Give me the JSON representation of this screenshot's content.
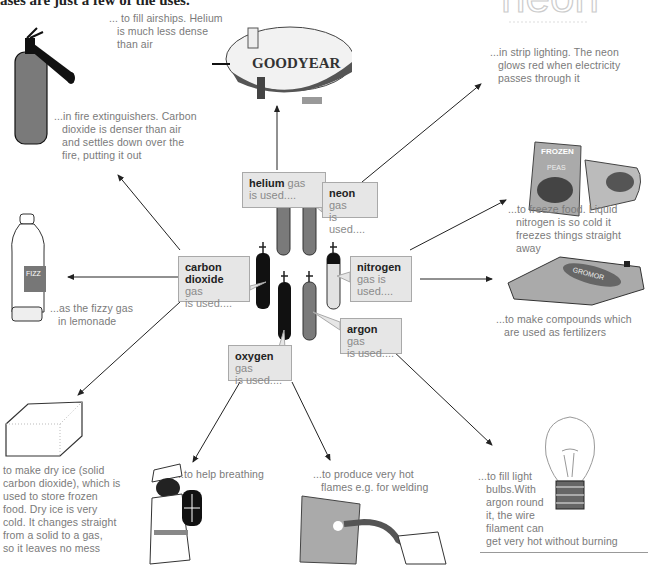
{
  "header_fragment": "ases are just a few of the uses.",
  "neon_sign_text": "neon",
  "gases": [
    {
      "id": "helium",
      "name": "helium",
      "suffix": " gas",
      "line2": "is used....",
      "cylinder_color": "#7a7a7a",
      "cap_color": "#7a7a7a"
    },
    {
      "id": "neon",
      "name": "neon",
      "suffix": " gas",
      "line2": "is used....",
      "cylinder_color": "#7a7a7a",
      "cap_color": "#111111"
    },
    {
      "id": "carbon-dioxide",
      "name": "carbon",
      "name2": "dioxide",
      "suffix": " gas",
      "line2": "is used....",
      "cylinder_color": "#111111",
      "cap_color": "#111111"
    },
    {
      "id": "nitrogen",
      "name": "nitrogen",
      "suffix": "",
      "line2": "gas is",
      "line3": "used....",
      "cylinder_color": "#e2e2e2",
      "cap_color": "#111111"
    },
    {
      "id": "oxygen",
      "name": "oxygen",
      "suffix": " gas",
      "line2": "is used....",
      "cylinder_color": "#111111",
      "cap_color": "#111111"
    },
    {
      "id": "argon",
      "name": "argon",
      "suffix": " gas",
      "line2": "is used....",
      "cylinder_color": "#7a7a7a",
      "cap_color": "#7a7a7a"
    }
  ],
  "uses": {
    "airships": [
      "... to fill airships. Helium",
      "is much less dense",
      "than air"
    ],
    "strip_lighting": [
      "...in strip lighting. The neon",
      "glows red when electricity",
      "passes through it"
    ],
    "fire_extinguishers": [
      "...in fire extinguishers. Carbon",
      "dioxide is denser than air",
      "and settles down over the",
      "fire, putting it out"
    ],
    "freeze_food": [
      "...to freeze food. Liquid",
      "nitrogen is so cold it",
      "freezes things straight away"
    ],
    "fizzy_gas": [
      "...as the fizzy gas",
      "in lemonade"
    ],
    "fertilizers": [
      "...to make compounds which",
      "are used as fertilizers"
    ],
    "dry_ice": [
      "to make dry ice (solid",
      "carbon dioxide), which is",
      "used to store frozen",
      "food. Dry ice is very",
      "cold. It changes straight",
      "from a solid to a gas,",
      "so it leaves no mess"
    ],
    "breathing": [
      "...to help breathing"
    ],
    "welding": [
      "...to produce very hot",
      "flames e.g. for welding"
    ],
    "light_bulbs": [
      "...to fill light",
      "bulbs.With",
      "argon round",
      "it, the wire",
      "filament can",
      "get very hot without burning"
    ]
  },
  "image_labels": {
    "airship_brand": "GOODYEAR",
    "frozen_pack": "FROZEN",
    "frozen_pack_sub": "PEAS",
    "fertilizer_bag": "GROMOR",
    "bottle_label": "FIZZ"
  },
  "colors": {
    "box_fill": "#e6e6e6",
    "box_border": "#a9a9a9",
    "text_grey": "#7a7a7a",
    "cylinder_dark": "#111111",
    "cylinder_mid": "#7a7a7a",
    "cylinder_light": "#e2e2e2"
  }
}
